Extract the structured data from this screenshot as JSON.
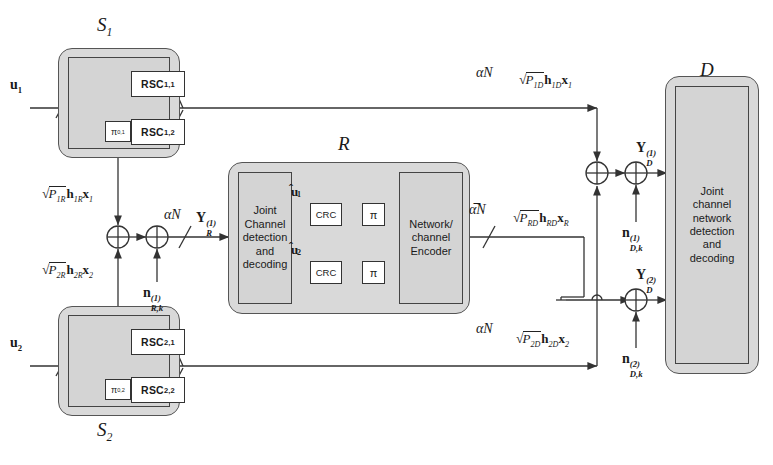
{
  "diagram": {
    "type": "block-diagram"
  },
  "nodes": {
    "source1": {
      "label": "S",
      "label_sub": "1",
      "input": "u",
      "input_sub": "1",
      "encoders": [
        {
          "name": "RSC",
          "sub": "1,1"
        },
        {
          "name": "RSC",
          "sub": "1,2"
        }
      ],
      "interleaver": "π",
      "interleaver_sub": "0,1"
    },
    "source2": {
      "label": "S",
      "label_sub": "2",
      "input": "u",
      "input_sub": "2",
      "encoders": [
        {
          "name": "RSC",
          "sub": "2,1"
        },
        {
          "name": "RSC",
          "sub": "2,2"
        }
      ],
      "interleaver": "π",
      "interleaver_sub": "0,2"
    },
    "relay": {
      "label": "R",
      "decoder_text": [
        "Joint",
        "Channel",
        "detection",
        "and",
        "decoding"
      ],
      "encoder_text": [
        "Network/",
        "channel",
        "Encoder"
      ],
      "branches": [
        {
          "signal": "u",
          "signal_sub": "1",
          "crc": "CRC",
          "interleaver": "π"
        },
        {
          "signal": "u",
          "signal_sub": "2",
          "crc": "CRC",
          "interleaver": "π"
        }
      ]
    },
    "destination": {
      "label": "D",
      "text": [
        "Joint",
        "channel",
        "network",
        "detection",
        "and",
        "decoding"
      ]
    }
  },
  "links": {
    "s1_to_d": {
      "rate": "αN",
      "gain_p": "P",
      "gain_p_sub": "1D",
      "h": "h",
      "h_sub": "1D",
      "x": "x",
      "x_sub": "1"
    },
    "s2_to_d": {
      "rate": "αN",
      "gain_p": "P",
      "gain_p_sub": "2D",
      "h": "h",
      "h_sub": "2D",
      "x": "x",
      "x_sub": "2"
    },
    "s1_to_r": {
      "gain_p": "P",
      "gain_p_sub": "1R",
      "h": "h",
      "h_sub": "1R",
      "x": "x",
      "x_sub": "1"
    },
    "s2_to_r": {
      "gain_p": "P",
      "gain_p_sub": "2R",
      "h": "h",
      "h_sub": "2R",
      "x": "x",
      "x_sub": "2"
    },
    "r_to_d": {
      "rate": "α̅N",
      "gain_p": "P",
      "gain_p_sub": "RD",
      "h": "h",
      "h_sub": "RD",
      "x": "x",
      "x_sub": "R"
    },
    "relay_input": {
      "rate": "αN",
      "signal": "Y",
      "signal_sub": "R",
      "signal_sup": "(1)"
    }
  },
  "signals": {
    "relay_noise": {
      "n": "n",
      "n_sub": "R,k",
      "n_sup": "(1)"
    },
    "dest_rx_1": {
      "y": "Y",
      "y_sub": "D",
      "y_sup": "(1)"
    },
    "dest_noise_1": {
      "n": "n",
      "n_sub": "D,k",
      "n_sup": "(1)"
    },
    "dest_rx_2": {
      "y": "Y",
      "y_sub": "D",
      "y_sup": "(2)"
    },
    "dest_noise_2": {
      "n": "n",
      "n_sub": "D,k",
      "n_sup": "(2)"
    }
  },
  "colors": {
    "shell_fill": "#d9d9d9",
    "inner_fill": "#d4d4d4",
    "line": "#333333",
    "box_fill": "#ffffff"
  }
}
